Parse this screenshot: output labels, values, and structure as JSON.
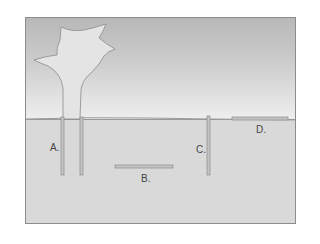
{
  "diagram": {
    "colors": {
      "sky_top": "#b8b8b8",
      "sky_bottom": "#eeeeee",
      "ground": "#d9d9d9",
      "tree": "#e4e4e4",
      "rod": "#c4c4c4",
      "outline": "#8c8c8c"
    },
    "labels": {
      "a": "A.",
      "b": "B.",
      "c": "C.",
      "d": "D."
    }
  }
}
